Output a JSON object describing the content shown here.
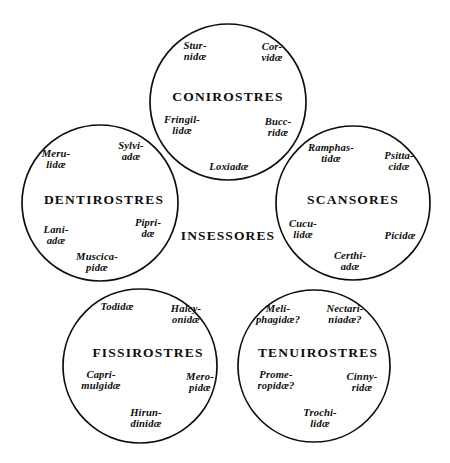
{
  "plate": {
    "center_label": "INSESSORES",
    "background": "#ffffff",
    "ink": "#0d0d0d"
  },
  "circles": [
    {
      "id": "conirostres",
      "order": "CONIROSTRES",
      "cx": 228,
      "cy": 102,
      "r": 78,
      "order_x": 228,
      "order_y": 97,
      "families": [
        {
          "name": "sturnidae",
          "lines": [
            "Stur-",
            "nidæ"
          ],
          "x": 195,
          "y": 52
        },
        {
          "name": "corvidae",
          "lines": [
            "Cor-",
            "vidæ"
          ],
          "x": 272,
          "y": 53
        },
        {
          "name": "fringillidae",
          "lines": [
            "Fringil-",
            "lidæ"
          ],
          "x": 182,
          "y": 126
        },
        {
          "name": "buceridae",
          "lines": [
            "Bucc-",
            "ridæ"
          ],
          "x": 278,
          "y": 128
        },
        {
          "name": "loxiadae",
          "lines": [
            "Loxiadæ"
          ],
          "x": 229,
          "y": 167
        }
      ]
    },
    {
      "id": "dentirostres",
      "order": "DENTIROSTRES",
      "cx": 100,
      "cy": 203,
      "r": 78,
      "order_x": 104,
      "order_y": 200,
      "families": [
        {
          "name": "sylviadae",
          "lines": [
            "Sylvi-",
            "adæ"
          ],
          "x": 131,
          "y": 152
        },
        {
          "name": "merulidae",
          "lines": [
            "Meru-",
            "lidæ"
          ],
          "x": 56,
          "y": 160
        },
        {
          "name": "pipridae",
          "lines": [
            "Pipri-",
            "dæ"
          ],
          "x": 148,
          "y": 229
        },
        {
          "name": "laniadae",
          "lines": [
            "Lani-",
            "adæ"
          ],
          "x": 56,
          "y": 236
        },
        {
          "name": "muscicapidae",
          "lines": [
            "Muscica-",
            "pidæ"
          ],
          "x": 97,
          "y": 263
        }
      ]
    },
    {
      "id": "scansores",
      "order": "SCANSORES",
      "cx": 353,
      "cy": 203,
      "r": 77,
      "order_x": 353,
      "order_y": 200,
      "families": [
        {
          "name": "ramphastidae",
          "lines": [
            "Ramphas-",
            "tidæ"
          ],
          "x": 331,
          "y": 154
        },
        {
          "name": "psittacidae",
          "lines": [
            "Psitta-",
            "cidæ"
          ],
          "x": 399,
          "y": 162
        },
        {
          "name": "cuculidae",
          "lines": [
            "Cucu-",
            "lidæ"
          ],
          "x": 303,
          "y": 230
        },
        {
          "name": "picidae",
          "lines": [
            "Picidæ"
          ],
          "x": 400,
          "y": 236
        },
        {
          "name": "certhiadae",
          "lines": [
            "Certhi-",
            "adæ"
          ],
          "x": 350,
          "y": 262
        }
      ]
    },
    {
      "id": "fissirostres",
      "order": "FISSIROSTRES",
      "cx": 140,
      "cy": 366,
      "r": 77,
      "order_x": 148,
      "order_y": 353,
      "families": [
        {
          "name": "todidae",
          "lines": [
            "Todidæ"
          ],
          "x": 117,
          "y": 307
        },
        {
          "name": "halcyonidae",
          "lines": [
            "Halcy-",
            "onidæ"
          ],
          "x": 186,
          "y": 315
        },
        {
          "name": "caprimulgidae",
          "lines": [
            "Capri-",
            "mulgidæ"
          ],
          "x": 101,
          "y": 381
        },
        {
          "name": "meropidae",
          "lines": [
            "Mero-",
            "pidæ"
          ],
          "x": 200,
          "y": 383
        },
        {
          "name": "hirundinidae",
          "lines": [
            "Hirun-",
            "dinidæ"
          ],
          "x": 146,
          "y": 419
        }
      ]
    },
    {
      "id": "tenuirostres",
      "order": "TENUIROSTRES",
      "cx": 314,
      "cy": 366,
      "r": 76,
      "order_x": 318,
      "order_y": 353,
      "families": [
        {
          "name": "meliphagidae",
          "lines": [
            "Meli-",
            "phagidæ?"
          ],
          "x": 278,
          "y": 315
        },
        {
          "name": "nectariniadae",
          "lines": [
            "Nectari-",
            "niadæ?"
          ],
          "x": 345,
          "y": 315
        },
        {
          "name": "promeropidae",
          "lines": [
            "Prome-",
            "ropidæ?"
          ],
          "x": 276,
          "y": 381
        },
        {
          "name": "cinnyridae",
          "lines": [
            "Cinny-",
            "ridæ"
          ],
          "x": 362,
          "y": 383
        },
        {
          "name": "trochilidae",
          "lines": [
            "Trochi-",
            "lidæ"
          ],
          "x": 320,
          "y": 419
        }
      ]
    }
  ],
  "center": {
    "label": "INSESSORES",
    "x": 228,
    "y": 236
  }
}
